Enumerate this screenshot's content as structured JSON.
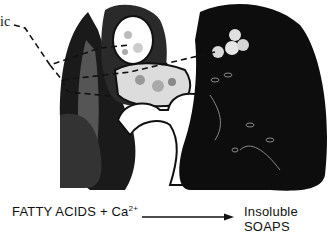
{
  "figure": {
    "label_partial": "ic",
    "equation": {
      "reactant": "FATTY ACIDS + Ca",
      "reactant_superscript": "2+",
      "product": "Insoluble SOAPS"
    },
    "colors": {
      "ink": "#111111",
      "paper": "#ffffff"
    }
  }
}
